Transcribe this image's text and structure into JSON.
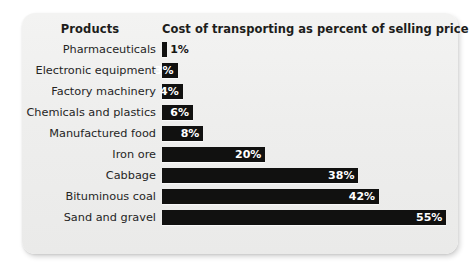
{
  "header": {
    "products_label": "Products",
    "cost_label": "Cost of transporting as percent of selling price"
  },
  "chart_data": {
    "type": "bar",
    "orientation": "horizontal",
    "title": "",
    "xlabel": "Cost of transporting as percent of selling price",
    "ylabel": "Products",
    "xlim": [
      0,
      55
    ],
    "grid": false,
    "legend": false,
    "categories": [
      "Pharmaceuticals",
      "Electronic equipment",
      "Factory machinery",
      "Chemicals and plastics",
      "Manufactured food",
      "Iron ore",
      "Cabbage",
      "Bituminous coal",
      "Sand and gravel"
    ],
    "values": [
      1,
      3,
      4,
      6,
      8,
      20,
      38,
      42,
      55
    ],
    "data_labels": [
      "1%",
      "3%",
      "4%",
      "6%",
      "8%",
      "20%",
      "38%",
      "42%",
      "55%"
    ],
    "bar_color": "#111110",
    "label_inside": [
      false,
      true,
      true,
      true,
      true,
      true,
      true,
      true,
      true
    ]
  },
  "style": {
    "card_background": "#eeeeed",
    "page_background": "#ffffff",
    "text_color": "#25251f"
  }
}
